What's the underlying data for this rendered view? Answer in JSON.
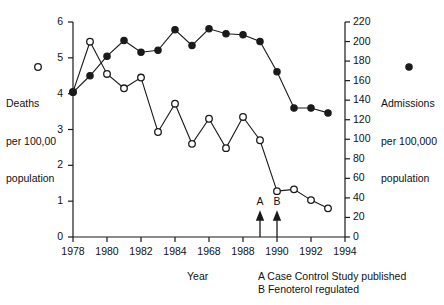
{
  "chart_data": {
    "type": "line",
    "title": "",
    "subtitle": "",
    "xlabel": "Year",
    "ylabel": "Deaths per 100,00 population",
    "ylabel_right": "Admissions per 100,000 population",
    "xlim": [
      1978,
      1994
    ],
    "ylim": [
      0,
      6
    ],
    "ylim_right": [
      0,
      220
    ],
    "grid": false,
    "legend_position": "outside-left-and-right",
    "x_ticks": [
      "1978",
      "1980",
      "1982",
      "1984",
      "1968",
      "1988",
      "1990",
      "1992",
      "1994"
    ],
    "x_tick_values": [
      1978,
      1980,
      1982,
      1984,
      1986,
      1988,
      1990,
      1992,
      1994
    ],
    "y_ticks_left": [
      "0",
      "1",
      "2",
      "3",
      "4",
      "5",
      "6"
    ],
    "y_tick_values_left": [
      0,
      1,
      2,
      3,
      4,
      5,
      6
    ],
    "y_ticks_right": [
      "0",
      "20",
      "40",
      "60",
      "80",
      "100",
      "120",
      "140",
      "160",
      "180",
      "200",
      "220"
    ],
    "y_tick_values_right": [
      0,
      20,
      40,
      60,
      80,
      100,
      120,
      140,
      160,
      180,
      200,
      220
    ],
    "x": [
      1978,
      1979,
      1980,
      1981,
      1982,
      1983,
      1984,
      1985,
      1986,
      1987,
      1988,
      1989,
      1990,
      1991,
      1992,
      1993
    ],
    "series": [
      {
        "name": "Deaths per 100,00 population",
        "marker": "open-circle",
        "axis": "left",
        "values": [
          4.05,
          5.45,
          4.55,
          4.15,
          4.45,
          2.93,
          3.72,
          2.6,
          3.3,
          2.48,
          3.35,
          2.7,
          1.28,
          1.33,
          1.03,
          0.8
        ]
      },
      {
        "name": "Admissions per 100,000 population",
        "marker": "filled-circle",
        "axis": "right",
        "values": [
          148,
          165,
          185,
          201,
          189,
          191,
          212,
          196,
          213,
          208,
          207,
          200,
          169,
          132,
          132,
          127
        ]
      }
    ],
    "annotations": [
      {
        "label": "A",
        "x": 1989,
        "text": "A Case Control Study published"
      },
      {
        "label": "B",
        "x": 1990,
        "text": "B Fenoterol regulated"
      }
    ],
    "legend_left": {
      "marker": "open-circle",
      "lines": [
        "Deaths",
        "per 100,00",
        "population"
      ]
    },
    "legend_right": {
      "marker": "filled-circle",
      "lines": [
        "Admissions",
        "per 100,000",
        "population"
      ]
    },
    "footnotes": [
      "A Case Control Study published",
      "B Fenoterol regulated"
    ],
    "colors": {
      "ink": "#1a1a1a",
      "background": "#ffffff",
      "marker_fill_open": "#ffffff"
    }
  }
}
